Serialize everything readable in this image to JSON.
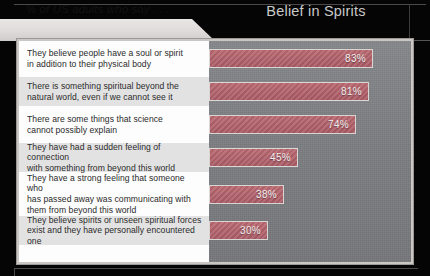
{
  "header": {
    "title": "Belief in Spirits",
    "subtitle": "% of US adults who say . . ."
  },
  "colors": {
    "bar_fill": "#b0606a",
    "bar_border": "#d9d6d4",
    "plot_background": "#7c7e81",
    "label_panel": "#fdfdfd",
    "label_stripe": "#e3e2e2",
    "title_text": "#c9c9c9",
    "page_background": "#050505"
  },
  "chart_data": {
    "type": "bar",
    "orientation": "horizontal",
    "title": "Belief in Spirits",
    "subtitle": "% of US adults who say . . .",
    "xlabel": "",
    "ylabel": "",
    "xlim": [
      0,
      100
    ],
    "grid": false,
    "legend": false,
    "value_suffix": "%",
    "categories": [
      "They believe people have a soul or spirit in addition to their physical body",
      "There is something spiritual beyond the natural world, even if we cannot see it",
      "There are some things that science cannot possibly explain",
      "They have had a sudden feeling of connection with something from beyond this world",
      "They have a strong feeling that someone who has passed away was communicating with them from beyond this world",
      "They believe spirits or unseen spiritual forces exist and they have personally encountered one"
    ],
    "values": [
      83,
      81,
      74,
      45,
      38,
      30
    ],
    "value_labels": [
      "83%",
      "81%",
      "74%",
      "45%",
      "38%",
      "30%"
    ]
  },
  "rows": [
    {
      "lines": [
        "They believe people have a soul or spirit",
        "in addition to their physical body"
      ],
      "value": 83,
      "value_label": "83%"
    },
    {
      "lines": [
        "There is something spiritual beyond the",
        "natural world, even if we cannot see it"
      ],
      "value": 81,
      "value_label": "81%"
    },
    {
      "lines": [
        "There are some things that science",
        "cannot possibly explain"
      ],
      "value": 74,
      "value_label": "74%"
    },
    {
      "lines": [
        "They have had a sudden feeling of connection",
        "with something from beyond this world"
      ],
      "value": 45,
      "value_label": "45%"
    },
    {
      "lines": [
        "They have a strong feeling that someone who",
        "has passed away was communicating with",
        "them from beyond this world"
      ],
      "value": 38,
      "value_label": "38%"
    },
    {
      "lines": [
        "They believe spirits or unseen spiritual forces",
        "exist and they have personally encountered one"
      ],
      "value": 30,
      "value_label": "30%"
    }
  ]
}
